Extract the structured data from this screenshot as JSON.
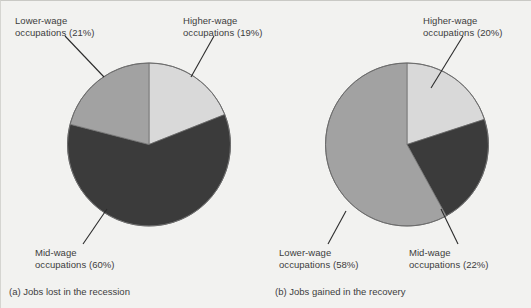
{
  "figure": {
    "background_color": "#f2f2f0",
    "text_color": "#3d3d3d"
  },
  "colors": {
    "higher_wage": "#d9d9d9",
    "mid_wage": "#3b3b3b",
    "lower_wage": "#a2a2a2",
    "outline": "#6b6b6b",
    "leader_line": "#2b2b2b"
  },
  "panels": {
    "a": {
      "caption": "(a) Jobs lost in the recession",
      "labels": {
        "lower": {
          "line1": "Lower-wage",
          "line2": "occupations (21%)"
        },
        "higher": {
          "line1": "Higher-wage",
          "line2": "occupations (19%)"
        },
        "mid": {
          "line1": "Mid-wage",
          "line2": "occupations (60%)"
        }
      }
    },
    "b": {
      "caption": "(b) Jobs gained in the recovery",
      "labels": {
        "higher": {
          "line1": "Higher-wage",
          "line2": "occupations (20%)"
        },
        "lower": {
          "line1": "Lower-wage",
          "line2": "occupations (58%)"
        },
        "mid": {
          "line1": "Mid-wage",
          "line2": "occupations (22%)"
        }
      }
    }
  },
  "chart_data": [
    {
      "type": "pie",
      "title": "(a) Jobs lost in the recession",
      "categories": [
        "Higher-wage occupations",
        "Mid-wage occupations",
        "Lower-wage occupations"
      ],
      "values": [
        19,
        60,
        21
      ],
      "units": "percent",
      "start_angle_deg": 0,
      "direction": "clockwise",
      "slice_colors": [
        "#d9d9d9",
        "#3b3b3b",
        "#a2a2a2"
      ],
      "labels": [
        "Higher-wage occupations (19%)",
        "Mid-wage occupations (60%)",
        "Lower-wage occupations (21%)"
      ],
      "legend": "none (leader-line callouts)"
    },
    {
      "type": "pie",
      "title": "(b) Jobs gained in the recovery",
      "categories": [
        "Higher-wage occupations",
        "Mid-wage occupations",
        "Lower-wage occupations"
      ],
      "values": [
        20,
        22,
        58
      ],
      "units": "percent",
      "start_angle_deg": 0,
      "direction": "clockwise",
      "slice_colors": [
        "#d9d9d9",
        "#3b3b3b",
        "#a2a2a2"
      ],
      "labels": [
        "Higher-wage occupations (20%)",
        "Mid-wage occupations (22%)",
        "Lower-wage occupations (58%)"
      ],
      "legend": "none (leader-line callouts)"
    }
  ]
}
